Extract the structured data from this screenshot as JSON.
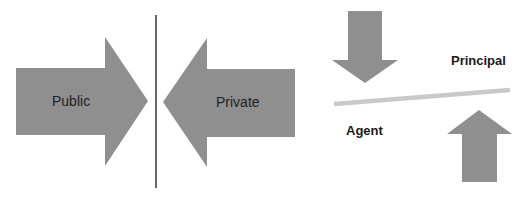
{
  "diagram": {
    "left_panel": {
      "public_arrow": {
        "label": "Public",
        "direction": "right",
        "color": "#8f8f8f"
      },
      "private_arrow": {
        "label": "Private",
        "direction": "left",
        "color": "#8f8f8f"
      },
      "divider": {
        "color": "#333333"
      }
    },
    "right_panel": {
      "principal_label": "Principal",
      "agent_label": "Agent",
      "down_arrow": {
        "direction": "down",
        "color": "#8f8f8f"
      },
      "up_arrow": {
        "direction": "up",
        "color": "#8f8f8f"
      },
      "balance_line": {
        "color": "#c9c9c9"
      }
    }
  }
}
